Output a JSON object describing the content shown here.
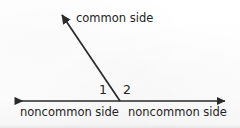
{
  "figure": {
    "background_color": "#fdfdfd",
    "stroke_color": "#2a2a2a",
    "text_color": "#242424"
  },
  "labels": {
    "common_side": "common side",
    "noncommon_side_left": "noncommon side",
    "noncommon_side_right": "noncommon side",
    "angle_one": "1",
    "angle_two": "2"
  },
  "geometry": {
    "vertex": {
      "x": 120,
      "y": 101
    },
    "baseline": {
      "left_end": {
        "x": 12,
        "y": 101
      },
      "right_end": {
        "x": 228,
        "y": 101
      },
      "arrowheads": "both"
    },
    "common_ray": {
      "from": {
        "x": 120,
        "y": 101
      },
      "to": {
        "x": 59,
        "y": 11
      },
      "arrowheads": "end"
    }
  }
}
